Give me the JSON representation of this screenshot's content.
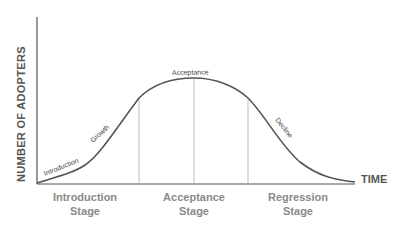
{
  "diagram": {
    "y_axis_label": "NUMBER OF ADOPTERS",
    "x_axis_label": "TIME",
    "curve_labels": {
      "introduction": "Introduction",
      "growth": "Growth",
      "acceptance": "Acceptance",
      "decline": "Decline"
    },
    "stages": [
      {
        "line1": "Introduction",
        "line2": "Stage"
      },
      {
        "line1": "Acceptance",
        "line2": "Stage"
      },
      {
        "line1": "Regression",
        "line2": "Stage"
      }
    ],
    "colors": {
      "axis": "#555555",
      "curve": "#555555",
      "divider": "#aaaaaa",
      "stage_text": "#8a8a8a"
    }
  }
}
